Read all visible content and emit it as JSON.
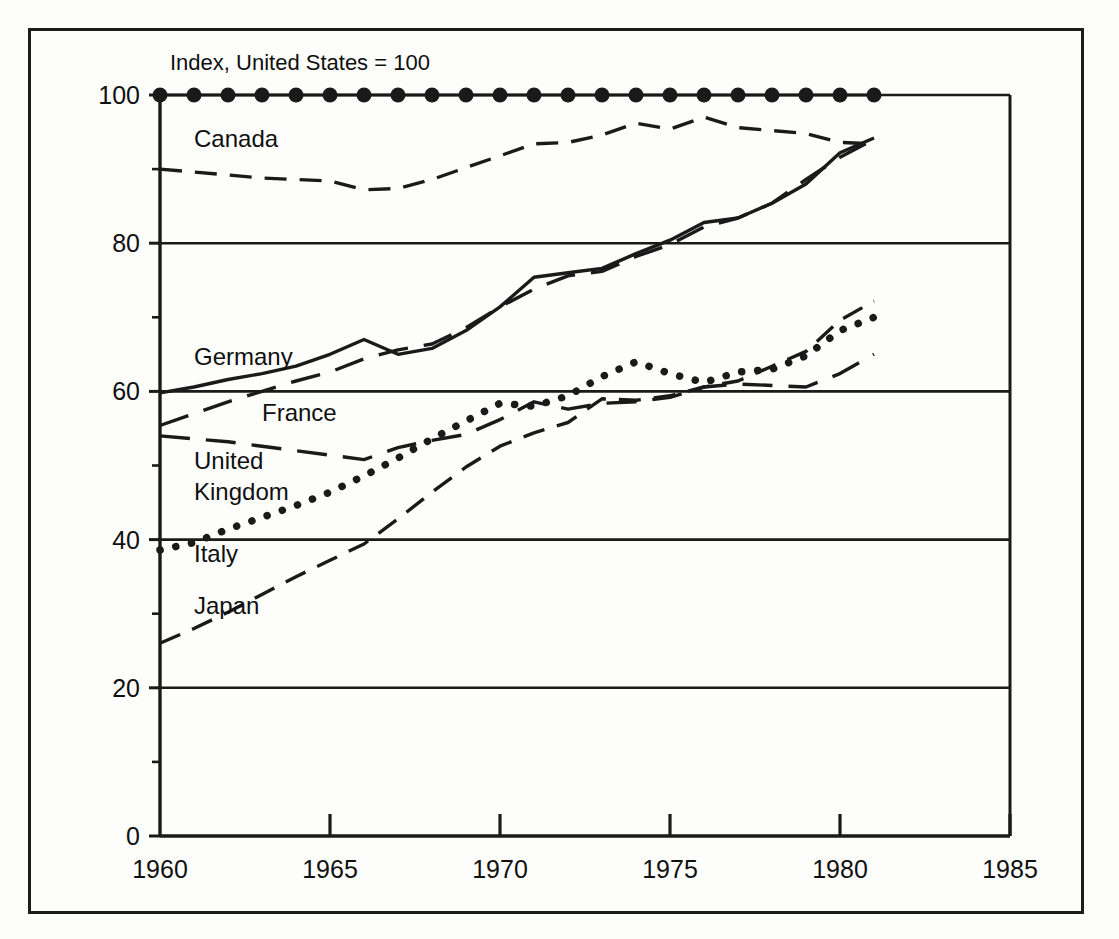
{
  "figure": {
    "background_color": "#fdfdfb",
    "frame_color": "#1c1c1c",
    "line_color": "#1a1a1a"
  },
  "chart_data": {
    "type": "line",
    "title": "Index, United States = 100",
    "xlabel": "",
    "ylabel": "",
    "xlim": [
      1960,
      1985
    ],
    "ylim": [
      0,
      100
    ],
    "xticks": [
      1960,
      1965,
      1970,
      1975,
      1980,
      1985
    ],
    "yticks": [
      0,
      20,
      40,
      60,
      80,
      100
    ],
    "grid": "horizontal",
    "legend_position": "inline-labels",
    "x": [
      1960,
      1961,
      1962,
      1963,
      1964,
      1965,
      1966,
      1967,
      1968,
      1969,
      1970,
      1971,
      1972,
      1973,
      1974,
      1975,
      1976,
      1977,
      1978,
      1979,
      1980,
      1981
    ],
    "series": [
      {
        "name": "United States",
        "style": "dotted-markers",
        "label_shown": false,
        "values": [
          100,
          100,
          100,
          100,
          100,
          100,
          100,
          100,
          100,
          100,
          100,
          100,
          100,
          100,
          100,
          100,
          100,
          100,
          100,
          100,
          100,
          100
        ]
      },
      {
        "name": "Canada",
        "style": "dashed",
        "label_shown": true,
        "label_x": 1961.0,
        "label_y": 93.0,
        "values": [
          90,
          89.6,
          89.2,
          88.8,
          88.6,
          88.4,
          87.2,
          87.4,
          88.6,
          90.2,
          91.8,
          93.4,
          93.6,
          94.6,
          96.2,
          95.4,
          97.0,
          95.6,
          95.2,
          94.8,
          93.6,
          93.4
        ]
      },
      {
        "name": "Germany",
        "style": "solid",
        "label_shown": true,
        "label_x": 1961.0,
        "label_y": 63.5,
        "values": [
          59.8,
          60.6,
          61.6,
          62.4,
          63.4,
          65.0,
          67.0,
          65.0,
          65.8,
          68.2,
          71.4,
          75.4,
          76.0,
          76.6,
          78.6,
          80.4,
          82.8,
          83.4,
          85.4,
          88.0,
          92.2,
          94.2
        ]
      },
      {
        "name": "France",
        "style": "long-dash",
        "label_shown": true,
        "label_x": 1963.0,
        "label_y": 56.0,
        "values": [
          55.4,
          57.0,
          58.6,
          60.0,
          61.4,
          62.6,
          64.4,
          65.6,
          66.4,
          68.6,
          71.4,
          73.8,
          75.6,
          76.2,
          78.2,
          79.8,
          82.2,
          83.4,
          85.4,
          88.6,
          91.6,
          94.0
        ]
      },
      {
        "name": "United Kingdom",
        "style": "long-dash",
        "label_shown": true,
        "label_x": 1961.0,
        "label_y": 49.5,
        "values": [
          54.0,
          53.6,
          53.2,
          52.6,
          52.0,
          51.4,
          50.8,
          52.4,
          53.4,
          54.2,
          56.2,
          58.6,
          57.6,
          58.4,
          58.6,
          59.2,
          60.6,
          61.0,
          60.8,
          60.6,
          62.4,
          65.0
        ]
      },
      {
        "name": "Italy",
        "style": "dotted",
        "label_shown": true,
        "label_x": 1961.0,
        "label_y": 37.0,
        "values": [
          38.6,
          39.6,
          41.4,
          43.0,
          44.6,
          46.4,
          48.6,
          51.0,
          53.6,
          56.0,
          58.4,
          58.0,
          59.4,
          62.0,
          64.0,
          62.4,
          61.2,
          62.6,
          63.0,
          64.8,
          68.2,
          70.0
        ]
      },
      {
        "name": "Japan",
        "style": "dashed",
        "label_shown": true,
        "label_x": 1961.0,
        "label_y": 30.0,
        "values": [
          26.0,
          28.0,
          30.2,
          32.6,
          35.0,
          37.2,
          39.4,
          42.8,
          46.4,
          49.8,
          52.6,
          54.4,
          55.8,
          59.0,
          58.8,
          59.4,
          60.6,
          61.4,
          63.4,
          65.4,
          69.6,
          72.2
        ]
      }
    ],
    "series_labels": [
      "Canada",
      "Germany",
      "France",
      "United Kingdom",
      "Italy",
      "Japan"
    ]
  }
}
